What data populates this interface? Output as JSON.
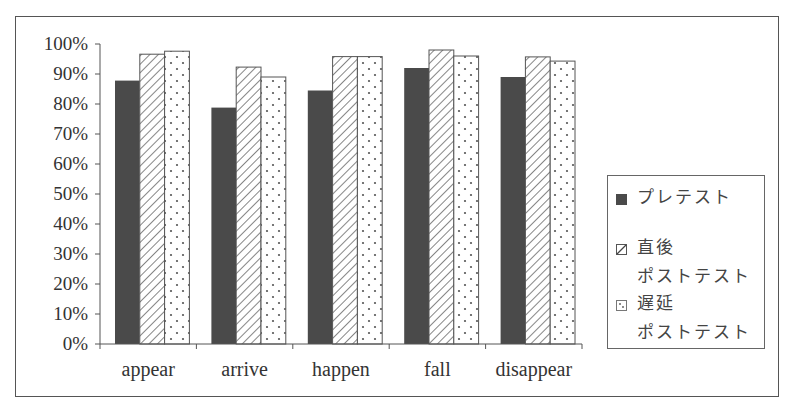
{
  "chart_data": {
    "type": "bar",
    "title": "",
    "xlabel": "",
    "ylabel": "",
    "categories": [
      "appear",
      "arrive",
      "happen",
      "fall",
      "disappear"
    ],
    "series": [
      {
        "name": "プレテスト",
        "pattern": "solid",
        "color": "#4a4a4a",
        "values": [
          87.8,
          78.8,
          84.5,
          92.0,
          89.0
        ]
      },
      {
        "name": "直後 ポストテスト",
        "pattern": "diagonal-stripes",
        "color": "#555555",
        "values": [
          96.6,
          92.3,
          95.8,
          98.0,
          95.7
        ]
      },
      {
        "name": "遅延 ポストテスト",
        "pattern": "dots",
        "color": "#555555",
        "values": [
          97.6,
          89.0,
          95.8,
          96.0,
          94.3
        ]
      }
    ],
    "yticks": [
      "0%",
      "10%",
      "20%",
      "30%",
      "40%",
      "50%",
      "60%",
      "70%",
      "80%",
      "90%",
      "100%"
    ],
    "ylim": [
      0,
      100
    ],
    "yunit": "%",
    "grid": false,
    "legend_position": "right"
  },
  "legend": {
    "items": [
      {
        "line1": "プレテスト",
        "line2": ""
      },
      {
        "line1": "直後",
        "line2": "ポストテスト"
      },
      {
        "line1": "遅延",
        "line2": "ポストテスト"
      }
    ]
  }
}
